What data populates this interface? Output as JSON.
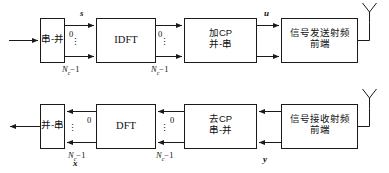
{
  "figure": {
    "stroke_color": "#1a1a1a",
    "text_color": "#111111",
    "background": "#ffffff"
  },
  "transmitter": {
    "blocks": [
      {
        "id": "tx-serial-to-parallel",
        "line1": "串-并",
        "line2": ""
      },
      {
        "id": "tx-idft",
        "line1": "IDFT",
        "line2": ""
      },
      {
        "id": "tx-add-cp",
        "line1": "加CP",
        "line2": "并-串"
      },
      {
        "id": "tx-rf-frontend",
        "line1": "信号发送射频",
        "line2": "前端"
      }
    ],
    "port_labels": {
      "top_index": "0",
      "vertical_dots": "⋮",
      "bottom_index_prefix": "N",
      "bottom_index_sub": "c",
      "bottom_index_suffix": "−1"
    },
    "signals": [
      {
        "id": "signal-s",
        "label": "s"
      },
      {
        "id": "signal-u",
        "label": "u"
      }
    ],
    "antenna": {
      "id": "tx-antenna",
      "label": ""
    }
  },
  "receiver": {
    "blocks": [
      {
        "id": "rx-parallel-to-serial",
        "line1": "并-串",
        "line2": ""
      },
      {
        "id": "rx-dft",
        "line1": "DFT",
        "line2": ""
      },
      {
        "id": "rx-remove-cp",
        "line1": "去CP",
        "line2": "串-并"
      },
      {
        "id": "rx-rf-frontend",
        "line1": "信号接收射频",
        "line2": "前端"
      }
    ],
    "port_labels": {
      "top_index": "0",
      "vertical_dots": "⋮",
      "bottom_index_prefix": "N",
      "bottom_index_sub": "c",
      "bottom_index_suffix": "−1"
    },
    "signals": [
      {
        "id": "signal-x",
        "label": "x"
      },
      {
        "id": "signal-y",
        "label": "y"
      }
    ],
    "antenna": {
      "id": "rx-antenna",
      "label": ""
    }
  }
}
